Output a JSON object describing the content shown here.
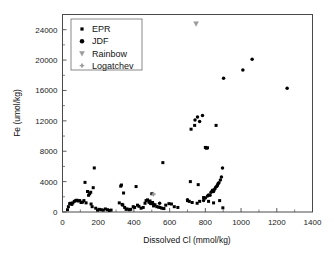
{
  "chart_data": {
    "type": "scatter",
    "title": "",
    "xlabel": "Dissolved Cl (mmol/kg)",
    "ylabel": "Fe (umol/kg)",
    "xlim": [
      0,
      1400
    ],
    "ylim": [
      0,
      26000
    ],
    "xticks": [
      0,
      200,
      400,
      600,
      800,
      1000,
      1200,
      1400
    ],
    "yticks": [
      0,
      4000,
      8000,
      12000,
      16000,
      20000,
      24000
    ],
    "xtick_labels": [
      "0",
      "200",
      "400",
      "600",
      "800",
      "1000",
      "1200",
      "1400"
    ],
    "ytick_labels": [
      "0",
      "4000",
      "8000",
      "12000",
      "16000",
      "20000",
      "24000"
    ],
    "x_minor_interval": 100,
    "y_minor_interval": 2000,
    "grid": false,
    "legend_position": "upper-left",
    "series": [
      {
        "name": "EPR",
        "marker": "square",
        "color": "#000000",
        "size": 3.0,
        "points": [
          [
            28,
            300
          ],
          [
            33,
            700
          ],
          [
            40,
            1100
          ],
          [
            46,
            1150
          ],
          [
            52,
            1000
          ],
          [
            58,
            1200
          ],
          [
            66,
            1400
          ],
          [
            74,
            1500
          ],
          [
            80,
            1550
          ],
          [
            88,
            1450
          ],
          [
            96,
            1500
          ],
          [
            104,
            1250
          ],
          [
            112,
            1300
          ],
          [
            120,
            1500
          ],
          [
            126,
            3900
          ],
          [
            132,
            1200
          ],
          [
            140,
            2700
          ],
          [
            146,
            2200
          ],
          [
            152,
            2400
          ],
          [
            158,
            2600
          ],
          [
            160,
            1050
          ],
          [
            166,
            700
          ],
          [
            172,
            3200
          ],
          [
            178,
            5800
          ],
          [
            186,
            500
          ],
          [
            196,
            250
          ],
          [
            206,
            350
          ],
          [
            216,
            300
          ],
          [
            228,
            250
          ],
          [
            240,
            400
          ],
          [
            252,
            300
          ],
          [
            262,
            200
          ],
          [
            272,
            250
          ],
          [
            318,
            1200
          ],
          [
            326,
            3400
          ],
          [
            330,
            3550
          ],
          [
            334,
            1000
          ],
          [
            338,
            900
          ],
          [
            342,
            2500
          ],
          [
            348,
            600
          ],
          [
            356,
            350
          ],
          [
            362,
            400
          ],
          [
            374,
            300
          ],
          [
            382,
            350
          ],
          [
            396,
            700
          ],
          [
            404,
            600
          ],
          [
            412,
            3350
          ],
          [
            420,
            900
          ],
          [
            428,
            750
          ],
          [
            440,
            500
          ],
          [
            452,
            600
          ],
          [
            462,
            1150
          ],
          [
            468,
            1500
          ],
          [
            476,
            1600
          ],
          [
            484,
            1300
          ],
          [
            490,
            1450
          ],
          [
            496,
            1100
          ],
          [
            500,
            2400
          ],
          [
            504,
            1250
          ],
          [
            510,
            800
          ],
          [
            518,
            950
          ],
          [
            528,
            700
          ],
          [
            538,
            650
          ],
          [
            546,
            600
          ],
          [
            556,
            500
          ],
          [
            562,
            6500
          ],
          [
            568,
            450
          ],
          [
            578,
            900
          ],
          [
            596,
            1100
          ],
          [
            610,
            1050
          ],
          [
            626,
            700
          ],
          [
            646,
            600
          ],
          [
            700,
            1500
          ],
          [
            710,
            1400
          ],
          [
            716,
            4000
          ],
          [
            720,
            10900
          ],
          [
            726,
            1250
          ],
          [
            740,
            11400
          ],
          [
            754,
            1150
          ],
          [
            760,
            3600
          ],
          [
            768,
            1400
          ],
          [
            790,
            1900
          ],
          [
            800,
            8500
          ],
          [
            806,
            8400
          ],
          [
            812,
            8450
          ],
          [
            818,
            1400
          ],
          [
            846,
            1200
          ],
          [
            860,
            11400
          ],
          [
            880,
            1500
          ],
          [
            898,
            550
          ]
        ]
      },
      {
        "name": "JDF",
        "marker": "circle",
        "color": "#000000",
        "size": 3.0,
        "points": [
          [
            492,
            1150
          ],
          [
            500,
            1200
          ],
          [
            508,
            1050
          ],
          [
            544,
            1150
          ],
          [
            700,
            1600
          ],
          [
            742,
            12100
          ],
          [
            756,
            12500
          ],
          [
            768,
            11900
          ],
          [
            784,
            12700
          ],
          [
            790,
            1500
          ],
          [
            800,
            1850
          ],
          [
            812,
            2100
          ],
          [
            818,
            2250
          ],
          [
            826,
            2200
          ],
          [
            832,
            2600
          ],
          [
            840,
            2850
          ],
          [
            846,
            2700
          ],
          [
            852,
            3000
          ],
          [
            858,
            3250
          ],
          [
            864,
            3400
          ],
          [
            868,
            3550
          ],
          [
            872,
            3750
          ],
          [
            876,
            3850
          ],
          [
            884,
            4200
          ],
          [
            890,
            4600
          ],
          [
            896,
            5800
          ],
          [
            902,
            17600
          ],
          [
            1010,
            18700
          ],
          [
            1062,
            20100
          ],
          [
            1258,
            16300
          ]
        ]
      },
      {
        "name": "Rainbow",
        "marker": "triangle-down",
        "color": "#9a9a9a",
        "size": 4.0,
        "points": [
          [
            748,
            24800
          ]
        ]
      },
      {
        "name": "Logatchev",
        "marker": "plus-circle",
        "color": "#9a9a9a",
        "size": 4.0,
        "points": [
          [
            510,
            2350
          ]
        ]
      }
    ],
    "legend_entries": [
      {
        "label": "EPR",
        "marker": "square",
        "color": "#000000"
      },
      {
        "label": "JDF",
        "marker": "circle",
        "color": "#000000"
      },
      {
        "label": "Rainbow",
        "marker": "triangle-down",
        "color": "#9a9a9a"
      },
      {
        "label": "Logatchev",
        "marker": "plus-circle",
        "color": "#9a9a9a"
      }
    ]
  }
}
